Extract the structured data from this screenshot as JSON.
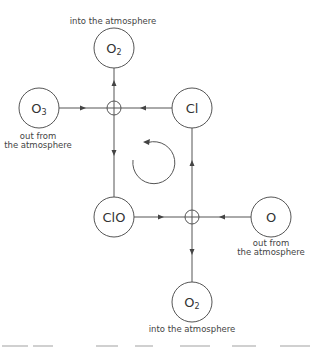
{
  "diagram": {
    "type": "chlorine catalytic ozone destruction cycle",
    "nodes": [
      {
        "id": "o2_top",
        "label": "O",
        "subscript": "2",
        "caption": [
          "into the atmosphere"
        ]
      },
      {
        "id": "o3",
        "label": "O",
        "subscript": "3",
        "caption": [
          "out from",
          "the atmosphere"
        ]
      },
      {
        "id": "cl",
        "label": "Cl",
        "subscript": "",
        "caption": []
      },
      {
        "id": "clo",
        "label": "ClO",
        "subscript": "",
        "caption": []
      },
      {
        "id": "o",
        "label": "O",
        "subscript": "",
        "caption": [
          "out from",
          "the atmosphere"
        ]
      },
      {
        "id": "o2_bottom",
        "label": "O",
        "subscript": "2",
        "caption": [
          "into the atmosphere"
        ]
      }
    ],
    "junctions": [
      {
        "id": "reaction_1",
        "inputs": [
          "o3",
          "cl"
        ],
        "outputs": [
          "o2_top",
          "clo"
        ]
      },
      {
        "id": "reaction_2",
        "inputs": [
          "clo",
          "o"
        ],
        "outputs": [
          "o2_bottom",
          "cl"
        ]
      }
    ],
    "cycle_arrow": {
      "direction": "counterclockwise"
    },
    "colors": {
      "stroke": "#555555",
      "text": "#333333",
      "background": "#ffffff"
    }
  }
}
